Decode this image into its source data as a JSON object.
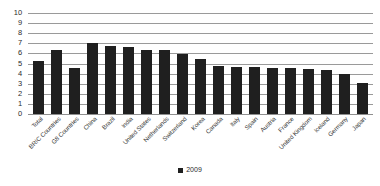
{
  "chart_data": {
    "type": "bar",
    "title": "",
    "subtitle": "",
    "xlabel": "",
    "ylabel": "",
    "ylim": [
      0,
      10
    ],
    "ytick_step": 1,
    "yticks": [
      "10",
      "9",
      "8",
      "7",
      "6",
      "5",
      "4",
      "3",
      "2",
      "1",
      "0"
    ],
    "grid": true,
    "legend_position": "bottom-center",
    "bar_color": "#1f1f1f",
    "gridline_color": "#9a9a9a",
    "categories": [
      "Total",
      "BRIC Countries",
      "G8 Countries",
      "China",
      "Brazil",
      "India",
      "United States",
      "Netherlands",
      "Switzerland",
      "Korea",
      "Canada",
      "Italy",
      "Spain",
      "Austria",
      "France",
      "United Kingdom",
      "Iceland",
      "Germany",
      "Japan"
    ],
    "series": [
      {
        "name": "2009",
        "values": [
          5.2,
          6.3,
          4.6,
          7.0,
          6.7,
          6.6,
          6.3,
          6.3,
          5.9,
          5.4,
          4.8,
          4.7,
          4.7,
          4.6,
          4.6,
          4.5,
          4.4,
          4.0,
          3.1
        ]
      }
    ]
  },
  "legend": {
    "entries": [
      {
        "label": "2009",
        "color": "#1f1f1f",
        "marker": "square-marker"
      }
    ]
  }
}
